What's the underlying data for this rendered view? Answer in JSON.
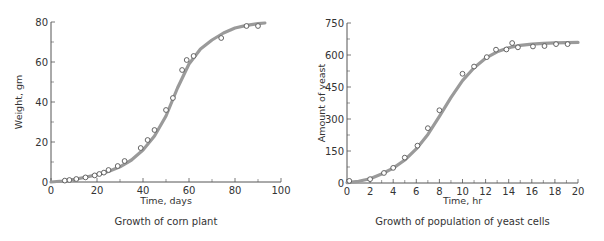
{
  "colors": {
    "curve": "#9a9a9a",
    "axis": "#555555",
    "marker": "#555555",
    "text": "#333333"
  },
  "chart_data": [
    {
      "type": "scatter",
      "title": "Growth of corn plant",
      "xlabel": "Time, days",
      "ylabel": "Weight, gm",
      "xlim": [
        0,
        100
      ],
      "ylim": [
        0,
        80
      ],
      "xticks": [
        0,
        20,
        40,
        60,
        80,
        100
      ],
      "xminor": [
        10,
        30,
        50,
        70,
        90
      ],
      "yticks": [
        0,
        20,
        40,
        60,
        80
      ],
      "yminor": [
        10,
        30,
        50,
        70
      ],
      "grid": false,
      "series": [
        {
          "name": "observed",
          "x": [
            6,
            8,
            11,
            15,
            19,
            21,
            23,
            25,
            29,
            32,
            39,
            42,
            45,
            50,
            53,
            57,
            59,
            62,
            74,
            85,
            90
          ],
          "y": [
            0.7,
            1,
            1.5,
            2.3,
            3.3,
            4,
            4.7,
            6,
            8,
            10.5,
            17,
            21,
            26,
            36,
            42,
            56,
            61,
            63,
            72,
            78,
            78
          ]
        },
        {
          "name": "fitted curve",
          "x": [
            0,
            5,
            10,
            15,
            20,
            25,
            30,
            35,
            40,
            45,
            50,
            55,
            60,
            65,
            70,
            75,
            80,
            85,
            90,
            93
          ],
          "y": [
            0,
            0.5,
            1.3,
            2.4,
            3.7,
            5.3,
            7.6,
            11,
            16,
            23,
            33,
            47,
            59,
            66.5,
            71,
            74.5,
            77,
            78.3,
            79.2,
            79.5
          ]
        }
      ]
    },
    {
      "type": "scatter",
      "title": "Growth of population of yeast cells",
      "xlabel": "Time, hr",
      "ylabel": "Amount of yeast",
      "xlim": [
        0,
        20
      ],
      "ylim": [
        0,
        750
      ],
      "xticks": [
        0,
        2,
        4,
        6,
        8,
        10,
        12,
        14,
        16,
        18,
        20
      ],
      "xminor": [
        1,
        3,
        5,
        7,
        9,
        11,
        13,
        15,
        17,
        19
      ],
      "yticks": [
        0,
        150,
        300,
        450,
        600,
        750
      ],
      "yminor": [
        75,
        225,
        375,
        525,
        675
      ],
      "grid": false,
      "series": [
        {
          "name": "observed",
          "x": [
            0.2,
            2,
            3.2,
            4,
            5,
            6.1,
            7,
            8,
            10,
            11,
            12.1,
            12.9,
            13.8,
            14.3,
            14.8,
            16.1,
            17.1,
            18.1,
            19.1
          ],
          "y": [
            10,
            18,
            47,
            71,
            119,
            175,
            257,
            341,
            512,
            546,
            590,
            625,
            626,
            656,
            636,
            640,
            642,
            651,
            651
          ]
        },
        {
          "name": "fitted curve",
          "x": [
            0,
            1,
            2,
            3,
            4,
            5,
            6,
            7,
            8,
            9,
            10,
            11,
            12,
            13,
            14,
            15,
            16,
            17,
            18,
            19,
            20
          ],
          "y": [
            2,
            8,
            20,
            42,
            70,
            108,
            160,
            228,
            312,
            400,
            480,
            540,
            585,
            615,
            634,
            645,
            651,
            655,
            657,
            658,
            659
          ]
        }
      ]
    }
  ],
  "panels": [
    {
      "title": "Growth of corn plant",
      "xlabel": "Time, days",
      "ylabel": "Weight, gm"
    },
    {
      "title": "Growth of population of yeast cells",
      "xlabel": "Time, hr",
      "ylabel": "Amount of yeast"
    }
  ]
}
